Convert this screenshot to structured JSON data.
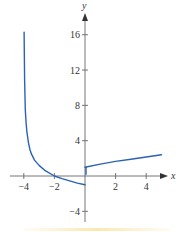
{
  "chart_data": {
    "type": "line",
    "title": "",
    "xlabel": "x",
    "ylabel": "y",
    "xlim": [
      -4.5,
      5.3
    ],
    "ylim": [
      -5,
      18
    ],
    "grid": false,
    "legend": null,
    "x_ticks": [
      -4,
      -2,
      2,
      4
    ],
    "y_ticks": [
      16,
      12,
      8,
      4,
      -4
    ],
    "x_tick_labels": [
      "−4",
      "−2",
      "2",
      "4"
    ],
    "y_tick_labels": [
      "16",
      "12",
      "8",
      "4",
      "−4"
    ],
    "series": [
      {
        "name": "left branch (x < 0)",
        "color": "#2a62b8",
        "x": [
          -3.98,
          -3.95,
          -3.9,
          -3.85,
          -3.8,
          -3.7,
          -3.6,
          -3.5,
          -3.3,
          -3.0,
          -2.6,
          -2.0,
          -1.5,
          -1.0,
          -0.5,
          0.0
        ],
        "y": [
          16.3,
          11.0,
          7.5,
          6.0,
          5.0,
          3.8,
          3.0,
          2.5,
          1.8,
          1.2,
          0.6,
          0.0,
          -0.3,
          -0.55,
          -0.8,
          -1.0
        ],
        "open_end_at_x0": true
      },
      {
        "name": "right branch (x >= 0)",
        "color": "#2a62b8",
        "x": [
          0,
          1,
          2,
          3,
          4,
          5
        ],
        "y": [
          1.0,
          1.35,
          1.65,
          1.9,
          2.15,
          2.4
        ]
      }
    ],
    "annotations": [
      {
        "type": "vertical_asymptote",
        "x": -4
      },
      {
        "type": "jump_discontinuity",
        "x": 0,
        "from": -1,
        "to": 1
      }
    ]
  },
  "axes": {
    "x_label": "x",
    "y_label": "y",
    "color": "#555555"
  },
  "curve_color": "#2a62b8"
}
